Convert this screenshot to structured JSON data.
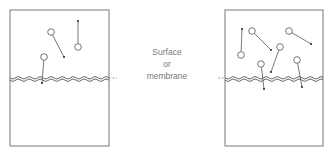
{
  "diagram": {
    "label": {
      "line1": "Surface",
      "line2": "or",
      "line3": "membrane"
    },
    "colors": {
      "stroke": "#555555",
      "box": "#777777",
      "text": "#777777",
      "background": "#ffffff"
    },
    "panels": [
      {
        "name": "left-panel",
        "box": {
          "x": 10,
          "y": 10,
          "w": 99,
          "h": 136
        },
        "membrane_y": 79,
        "molecules": [
          {
            "head": [
              51,
              32
            ],
            "tail": [
              64,
              57
            ]
          },
          {
            "head": [
              78,
              47
            ],
            "tail": [
              78,
              21
            ]
          },
          {
            "head": [
              44,
              57
            ],
            "tail": [
              42,
              83
            ]
          }
        ]
      },
      {
        "name": "right-panel",
        "box": {
          "x": 225,
          "y": 10,
          "w": 98,
          "h": 136
        },
        "membrane_y": 79,
        "molecules": [
          {
            "head": [
              241,
              55
            ],
            "tail": [
              242,
              29
            ]
          },
          {
            "head": [
              252,
              31
            ],
            "tail": [
              271,
              50
            ]
          },
          {
            "head": [
              289,
              31
            ],
            "tail": [
              311,
              44
            ]
          },
          {
            "head": [
              280,
              47
            ],
            "tail": [
              271,
              72
            ]
          },
          {
            "head": [
              261,
              64
            ],
            "tail": [
              264,
              89
            ]
          },
          {
            "head": [
              297,
              60
            ],
            "tail": [
              302,
              87
            ]
          }
        ]
      }
    ]
  }
}
